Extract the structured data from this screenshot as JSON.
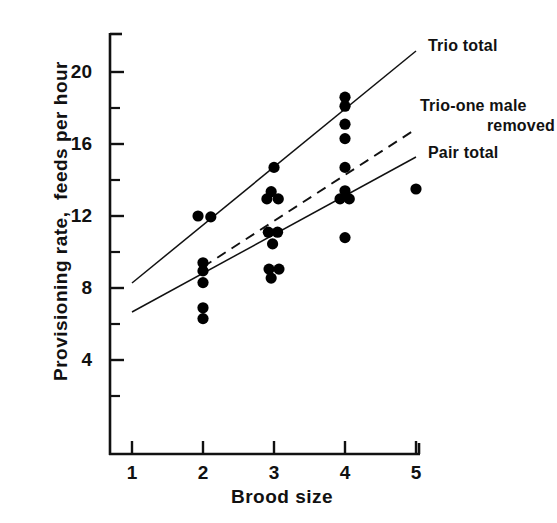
{
  "chart_data": {
    "type": "scatter",
    "title": "",
    "xlabel": "Brood size",
    "ylabel": "Provisioning rate,  feeds per hour",
    "xlim": [
      0.7,
      5.35
    ],
    "ylim": [
      1.0,
      21.6
    ],
    "xticks": [
      1,
      2,
      3,
      4,
      5
    ],
    "xtick_labels": [
      "1",
      "2",
      "3",
      "4",
      "5"
    ],
    "yticks": [
      4,
      8,
      12,
      16,
      20
    ],
    "ytick_labels": [
      "4",
      "8",
      "12",
      "16",
      "20"
    ],
    "yminor_ticks": [
      2,
      6,
      10,
      14,
      18
    ],
    "grid": false,
    "legend_position": "right-outside",
    "points": [
      {
        "x": 1.93,
        "y": 12.0
      },
      {
        "x": 2.11,
        "y": 11.95
      },
      {
        "x": 2.0,
        "y": 9.4
      },
      {
        "x": 2.0,
        "y": 8.95
      },
      {
        "x": 2.0,
        "y": 8.3
      },
      {
        "x": 2.0,
        "y": 6.9
      },
      {
        "x": 2.0,
        "y": 6.3
      },
      {
        "x": 3.0,
        "y": 14.7
      },
      {
        "x": 2.96,
        "y": 13.35
      },
      {
        "x": 2.9,
        "y": 12.95
      },
      {
        "x": 3.06,
        "y": 12.95
      },
      {
        "x": 2.92,
        "y": 11.1
      },
      {
        "x": 3.05,
        "y": 11.1
      },
      {
        "x": 2.98,
        "y": 10.45
      },
      {
        "x": 2.93,
        "y": 9.05
      },
      {
        "x": 3.07,
        "y": 9.05
      },
      {
        "x": 2.96,
        "y": 8.55
      },
      {
        "x": 4.0,
        "y": 18.6
      },
      {
        "x": 4.0,
        "y": 18.1
      },
      {
        "x": 4.0,
        "y": 17.1
      },
      {
        "x": 4.0,
        "y": 16.3
      },
      {
        "x": 4.0,
        "y": 14.7
      },
      {
        "x": 4.0,
        "y": 13.4
      },
      {
        "x": 3.93,
        "y": 12.95
      },
      {
        "x": 4.06,
        "y": 12.95
      },
      {
        "x": 4.0,
        "y": 10.8
      },
      {
        "x": 5.0,
        "y": 13.5
      }
    ],
    "series": [
      {
        "name": "Trio total",
        "style": "solid",
        "x": [
          1.0,
          5.0
        ],
        "y": [
          8.6,
          21.0
        ],
        "label": "Trio total"
      },
      {
        "name": "Trio-one male removed",
        "style": "dashed",
        "x": [
          2.0,
          5.0
        ],
        "y": [
          9.5,
          17.2
        ],
        "label_line1": "Trio-one male",
        "label_line2": "removed"
      },
      {
        "name": "Pair total",
        "style": "solid",
        "x": [
          1.0,
          5.0
        ],
        "y": [
          7.0,
          15.3
        ],
        "label": "Pair total"
      }
    ]
  },
  "axes": {
    "x_axis_title": "Brood size",
    "y_axis_title": "Provisioning rate,  feeds per hour"
  },
  "legend": {
    "trio_total": "Trio total",
    "trio_one_male_line1": "Trio-one male",
    "trio_one_male_line2": "removed",
    "pair_total": "Pair total"
  },
  "colors": {
    "ink": "#111111",
    "background": "#ffffff",
    "marker": "#000000"
  }
}
